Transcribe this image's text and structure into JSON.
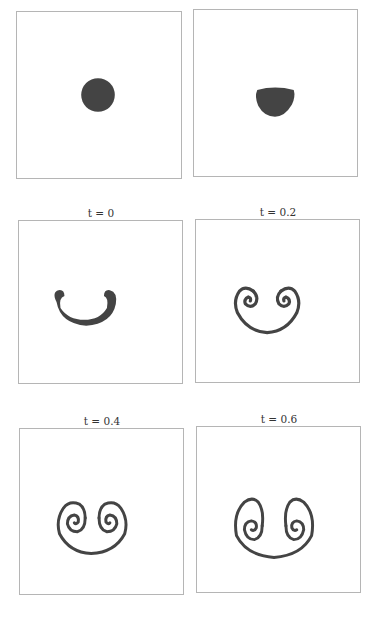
{
  "figure": {
    "fill_color": "#444444",
    "border_color": "#b5b5b5",
    "panels": [
      {
        "id": "p0",
        "caption": "",
        "shape": "circle"
      },
      {
        "id": "p1",
        "caption": "",
        "shape": "flattened-blob"
      },
      {
        "id": "p2",
        "caption": "t = 0",
        "shape": "horseshoe"
      },
      {
        "id": "p3",
        "caption": "t = 0.2",
        "shape": "double-spiral-small"
      },
      {
        "id": "p4",
        "caption": "t = 0.4",
        "shape": "double-spiral-medium"
      },
      {
        "id": "p5",
        "caption": "t = 0.6",
        "shape": "double-spiral-large"
      }
    ]
  }
}
